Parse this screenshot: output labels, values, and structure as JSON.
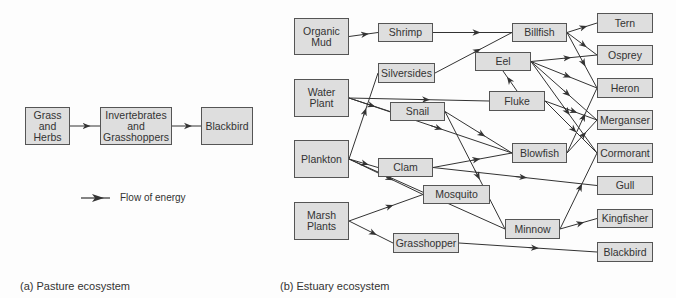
{
  "pasture": {
    "caption": "(a)  Pasture ecosystem",
    "nodes": [
      {
        "id": "grass",
        "label": "Grass\nand\nHerbs",
        "x": 25,
        "y": 107,
        "w": 45,
        "h": 38
      },
      {
        "id": "invert",
        "label": "Invertebrates\nand\nGrasshoppers",
        "x": 100,
        "y": 107,
        "w": 72,
        "h": 38
      },
      {
        "id": "blackbird_a",
        "label": "Blackbird",
        "x": 201,
        "y": 107,
        "w": 52,
        "h": 38
      }
    ],
    "edges": [
      [
        "grass",
        "invert"
      ],
      [
        "invert",
        "blackbird_a"
      ]
    ],
    "legend": {
      "label": "Flow of energy"
    }
  },
  "estuary": {
    "caption": "(b)  Estuary ecosystem",
    "nodes": [
      {
        "id": "organic_mud",
        "label": "Organic\nMud",
        "x": 294,
        "y": 18,
        "w": 55,
        "h": 37
      },
      {
        "id": "shrimp",
        "label": "Shrimp",
        "x": 378,
        "y": 23,
        "w": 55,
        "h": 19
      },
      {
        "id": "billfish",
        "label": "Billfish",
        "x": 512,
        "y": 23,
        "w": 55,
        "h": 19
      },
      {
        "id": "tern",
        "label": "Tern",
        "x": 597,
        "y": 13,
        "w": 56,
        "h": 20
      },
      {
        "id": "silversides",
        "label": "Silversides",
        "x": 378,
        "y": 63,
        "w": 57,
        "h": 20
      },
      {
        "id": "osprey",
        "label": "Osprey",
        "x": 597,
        "y": 45,
        "w": 56,
        "h": 20
      },
      {
        "id": "water_plant",
        "label": "Water\nPlant",
        "x": 294,
        "y": 79,
        "w": 55,
        "h": 38
      },
      {
        "id": "eel",
        "label": "Eel",
        "x": 475,
        "y": 52,
        "w": 56,
        "h": 19
      },
      {
        "id": "heron",
        "label": "Heron",
        "x": 597,
        "y": 78,
        "w": 56,
        "h": 20
      },
      {
        "id": "snail",
        "label": "Snail",
        "x": 390,
        "y": 102,
        "w": 55,
        "h": 19
      },
      {
        "id": "fluke",
        "label": "Fluke",
        "x": 489,
        "y": 91,
        "w": 56,
        "h": 20
      },
      {
        "id": "merganser",
        "label": "Merganser",
        "x": 597,
        "y": 110,
        "w": 56,
        "h": 20
      },
      {
        "id": "plankton",
        "label": "Plankton",
        "x": 294,
        "y": 140,
        "w": 55,
        "h": 38
      },
      {
        "id": "blowfish",
        "label": "Blowfish",
        "x": 512,
        "y": 143,
        "w": 55,
        "h": 20
      },
      {
        "id": "cormorant",
        "label": "Cormorant",
        "x": 597,
        "y": 143,
        "w": 56,
        "h": 20
      },
      {
        "id": "clam",
        "label": "Clam",
        "x": 378,
        "y": 158,
        "w": 55,
        "h": 19
      },
      {
        "id": "gull",
        "label": "Gull",
        "x": 597,
        "y": 176,
        "w": 56,
        "h": 19
      },
      {
        "id": "mosquito",
        "label": "Mosquito",
        "x": 423,
        "y": 185,
        "w": 67,
        "h": 19
      },
      {
        "id": "marsh_plants",
        "label": "Marsh\nPlants",
        "x": 294,
        "y": 202,
        "w": 55,
        "h": 38
      },
      {
        "id": "minnow",
        "label": "Minnow",
        "x": 505,
        "y": 219,
        "w": 55,
        "h": 20
      },
      {
        "id": "kingfisher",
        "label": "Kingfisher",
        "x": 597,
        "y": 209,
        "w": 56,
        "h": 19
      },
      {
        "id": "grasshopper",
        "label": "Grasshopper",
        "x": 393,
        "y": 233,
        "w": 66,
        "h": 20
      },
      {
        "id": "blackbird_b",
        "label": "Blackbird",
        "x": 597,
        "y": 242,
        "w": 56,
        "h": 20
      }
    ],
    "edges": [
      [
        "organic_mud",
        "shrimp"
      ],
      [
        "shrimp",
        "billfish"
      ],
      [
        "silversides",
        "billfish"
      ],
      [
        "billfish",
        "tern"
      ],
      [
        "billfish",
        "osprey"
      ],
      [
        "billfish",
        "heron"
      ],
      [
        "water_plant",
        "snail"
      ],
      [
        "water_plant",
        "fluke"
      ],
      [
        "water_plant",
        "blowfish"
      ],
      [
        "fluke",
        "eel"
      ],
      [
        "eel",
        "osprey"
      ],
      [
        "eel",
        "heron"
      ],
      [
        "eel",
        "merganser"
      ],
      [
        "eel",
        "cormorant"
      ],
      [
        "snail",
        "blowfish"
      ],
      [
        "snail",
        "minnow"
      ],
      [
        "fluke",
        "merganser"
      ],
      [
        "fluke",
        "cormorant"
      ],
      [
        "plankton",
        "silversides"
      ],
      [
        "plankton",
        "clam"
      ],
      [
        "plankton",
        "mosquito"
      ],
      [
        "plankton",
        "minnow"
      ],
      [
        "clam",
        "blowfish"
      ],
      [
        "clam",
        "gull"
      ],
      [
        "blowfish",
        "merganser"
      ],
      [
        "blowfish",
        "heron"
      ],
      [
        "marsh_plants",
        "mosquito"
      ],
      [
        "marsh_plants",
        "grasshopper"
      ],
      [
        "grasshopper",
        "blackbird_b"
      ],
      [
        "minnow",
        "kingfisher"
      ],
      [
        "minnow",
        "cormorant"
      ]
    ]
  }
}
